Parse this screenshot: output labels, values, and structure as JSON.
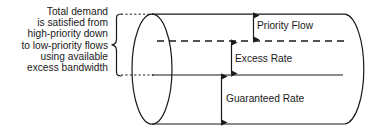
{
  "figure": {
    "type": "cylinder-bandwidth-allocation-diagram",
    "background_color": "#ffffff",
    "stroke_color": "#1a1a1a"
  },
  "caption": {
    "name": "total-demand-annotation",
    "lines": [
      "Total demand",
      "is satisfied from",
      "high-priority down",
      "to low-priority flows",
      "using available",
      "excess bandwidth"
    ]
  },
  "labels": {
    "priority_flow": "Priority Flow",
    "excess_rate": "Excess Rate",
    "guaranteed_rate": "Guaranteed Rate"
  },
  "bands": [
    {
      "name": "priority-flow",
      "label": "Priority Flow",
      "top_y": 14,
      "bottom_y": 41,
      "boundary_style": "dashed"
    },
    {
      "name": "excess-rate",
      "label": "Excess Rate",
      "top_y": 41,
      "bottom_y": 75,
      "boundary_style": "solid"
    },
    {
      "name": "guaranteed-rate",
      "label": "Guaranteed Rate",
      "top_y": 75,
      "bottom_y": 124,
      "boundary_style": "solid"
    }
  ],
  "geometry": {
    "cylinder_left_x": 152,
    "cylinder_right_x": 345,
    "cylinder_top_y": 14,
    "cylinder_bottom_y": 124,
    "cap_rx": 20,
    "brace_top_y": 14,
    "brace_bottom_y": 76
  }
}
